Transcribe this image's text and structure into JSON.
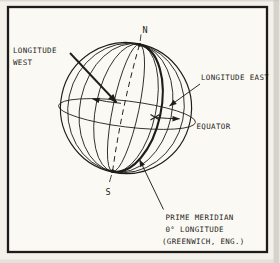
{
  "diagram": {
    "labels": {
      "north_pole": "N",
      "south_pole": "S",
      "longitude_west_line1": "LONGITUDE",
      "longitude_west_line2": "WEST",
      "longitude_east": "LONGITUDE EAST",
      "equator": "EQUATOR",
      "prime_meridian_line1": "PRIME MERIDIAN",
      "prime_meridian_line2": "0° LONGITUDE",
      "prime_meridian_line3": "(GREENWICH, ENG.)"
    },
    "colors": {
      "ink": "#1e1d1a",
      "paper": "#f3f1ea",
      "frame_fill": "#fbf9f4"
    }
  }
}
